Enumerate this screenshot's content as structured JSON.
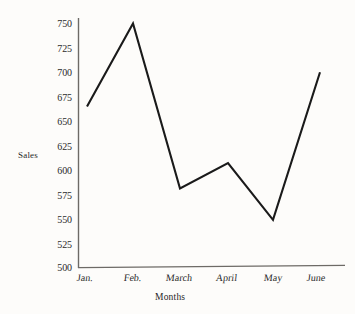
{
  "chart_data": {
    "type": "line",
    "title": "",
    "xlabel": "Months",
    "ylabel": "Sales",
    "categories": [
      "Jan.",
      "Feb.",
      "March",
      "April",
      "May",
      "June"
    ],
    "values": [
      665,
      750,
      581,
      607,
      549,
      700
    ],
    "series": [
      {
        "name": "Sales",
        "values": [
          665,
          750,
          581,
          607,
          549,
          700
        ]
      }
    ],
    "ylim": [
      500,
      750
    ],
    "ytick_step": 25,
    "ytick_labels": [
      "750",
      "725",
      "700",
      "675",
      "650",
      "625",
      "600",
      "575",
      "550",
      "525",
      "500"
    ],
    "ytick_values": [
      750,
      725,
      700,
      675,
      650,
      625,
      600,
      575,
      550,
      525,
      500
    ],
    "grid": false,
    "legend": "none",
    "line_color": "#1a1a1a",
    "axis_color": "#6d6a66",
    "background_color": "#fdfcfa"
  },
  "axes": {
    "y_title": "Sales",
    "x_title": "Months"
  }
}
